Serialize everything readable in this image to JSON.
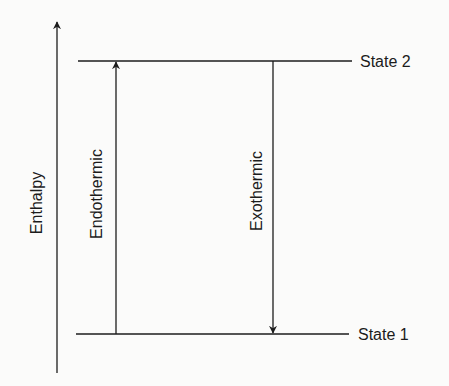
{
  "diagram": {
    "type": "enthalpy-level-diagram",
    "axis": {
      "label": "Enthalpy",
      "direction": "up"
    },
    "levels": [
      {
        "id": "state2",
        "label": "State 2",
        "position": "upper"
      },
      {
        "id": "state1",
        "label": "State 1",
        "position": "lower"
      }
    ],
    "transitions": [
      {
        "id": "endothermic",
        "label": "Endothermic",
        "from": "State 1",
        "to": "State 2",
        "direction": "up"
      },
      {
        "id": "exothermic",
        "label": "Exothermic",
        "from": "State 2",
        "to": "State 1",
        "direction": "down"
      }
    ],
    "colors": {
      "line": "#1c1c1c",
      "background": "#fbfbfa"
    }
  }
}
